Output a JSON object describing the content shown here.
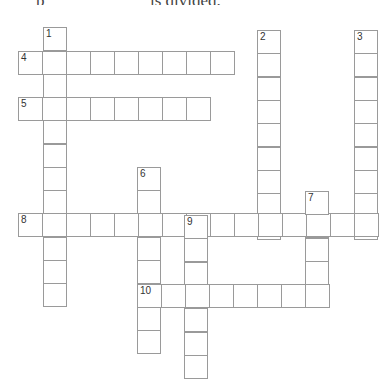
{
  "header": {
    "cut_text_left": "p",
    "cut_text_right": "                    is divided."
  },
  "crossword": {
    "cell_size": 24,
    "line_color": "#9a9a9a",
    "entries": [
      {
        "number": "1",
        "direction": "down",
        "x": 43,
        "y": 27,
        "length": 12,
        "step": 23.3
      },
      {
        "number": "2",
        "direction": "down",
        "x": 257,
        "y": 30,
        "length": 9,
        "step": 23.3
      },
      {
        "number": "3",
        "direction": "down",
        "x": 354,
        "y": 30,
        "length": 9,
        "step": 23.3
      },
      {
        "number": "4",
        "direction": "across",
        "x": 18,
        "y": 51,
        "length": 9,
        "step": 24
      },
      {
        "number": "5",
        "direction": "across",
        "x": 18,
        "y": 97,
        "length": 8,
        "step": 24
      },
      {
        "number": "6",
        "direction": "down",
        "x": 137,
        "y": 167,
        "length": 8,
        "step": 23.3
      },
      {
        "number": "7",
        "direction": "down",
        "x": 305,
        "y": 191,
        "length": 5,
        "step": 23.3
      },
      {
        "number": "8",
        "direction": "across",
        "x": 18,
        "y": 213,
        "length": 15,
        "step": 24
      },
      {
        "number": "9",
        "direction": "down",
        "x": 184,
        "y": 215,
        "length": 7,
        "step": 23.3
      },
      {
        "number": "10",
        "direction": "across",
        "x": 137,
        "y": 284,
        "length": 8,
        "step": 24
      }
    ]
  }
}
